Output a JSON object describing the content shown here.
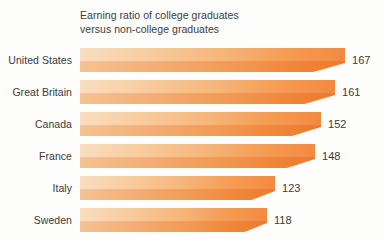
{
  "chart_data": {
    "type": "bar",
    "orientation": "horizontal",
    "title": "Earning ratio of college graduates\nversus non-college graduates",
    "xlabel": "",
    "ylabel": "",
    "grid": false,
    "legend": null,
    "axis_visible": false,
    "tick_labels": [],
    "xlim": [
      0,
      167
    ],
    "categories": [
      "United States",
      "Great Britain",
      "Canada",
      "France",
      "Italy",
      "Sweden"
    ],
    "values": [
      167,
      161,
      152,
      148,
      123,
      118
    ],
    "colors": {
      "bar_light": "#f9ddc0",
      "bar_mid": "#f6b477",
      "bar_dark": "#ed7a2c",
      "text": "#3a3a3a",
      "background": "#fdfdfc"
    },
    "bars": [
      {
        "category": "United States",
        "value": 167,
        "label": "167"
      },
      {
        "category": "Great Britain",
        "value": 161,
        "label": "161"
      },
      {
        "category": "Canada",
        "value": 152,
        "label": "152"
      },
      {
        "category": "France",
        "value": 148,
        "label": "148"
      },
      {
        "category": "Italy",
        "value": 123,
        "label": "123"
      },
      {
        "category": "Sweden",
        "value": 118,
        "label": "118"
      }
    ]
  }
}
